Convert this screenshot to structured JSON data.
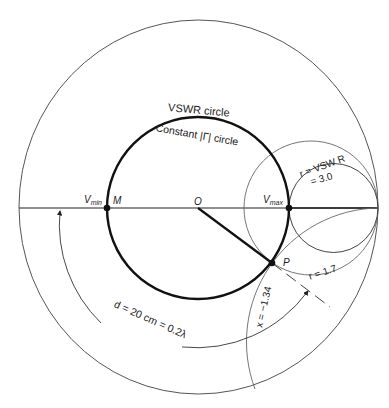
{
  "diagram": {
    "type": "smith-chart",
    "labels": {
      "vswr_circle": "VSWR circle",
      "constant_gamma": "Constant |Γ| circle",
      "vmin": "V",
      "vmin_sub": "min",
      "vmax": "V",
      "vmax_sub": "max",
      "m": "M",
      "o": "O",
      "p": "P",
      "r_vswr_line1": "r = VSW R",
      "r_vswr_line2": "= 3.0",
      "r_17": "r = 1.7",
      "x_134": "x = −1.34",
      "distance": "d = 20 cm = 0.2λ"
    },
    "values": {
      "vswr": 3.0,
      "r_at_P": 1.7,
      "x_at_P": -1.34,
      "d_cm": 20,
      "d_wavelengths": 0.2
    },
    "colors": {
      "thin_line": "#555555",
      "thick_line": "#111111",
      "text": "#222222"
    }
  }
}
